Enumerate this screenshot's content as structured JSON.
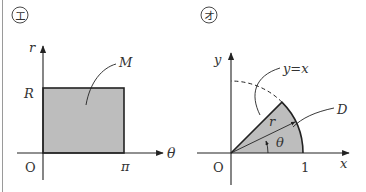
{
  "panels": [
    {
      "marker": "エ",
      "axes": {
        "vertical": "r",
        "horizontal": "θ",
        "origin": "O"
      },
      "ticks": {
        "vertical": "R",
        "horizontal": "π"
      },
      "region_label": "M",
      "shape": "rectangle"
    },
    {
      "marker": "オ",
      "axes": {
        "vertical": "y",
        "horizontal": "x",
        "origin": "O"
      },
      "ticks": {
        "horizontal": "1"
      },
      "line_label": "y=x",
      "region_label": "D",
      "radius_label": "r",
      "angle_label": "θ",
      "shape": "sector"
    }
  ],
  "colors": {
    "fill": "#bdbdbd",
    "stroke": "#222222",
    "border": "#9a9a9a"
  }
}
